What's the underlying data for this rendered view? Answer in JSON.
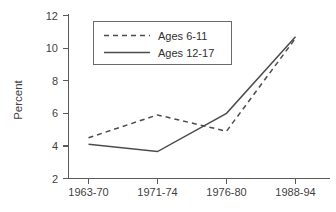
{
  "chart_data": {
    "type": "line",
    "title": "",
    "subtitle": "",
    "xlabel": "",
    "ylabel": "Percent",
    "categories": [
      "1963-70",
      "1971-74",
      "1976-80",
      "1988-94"
    ],
    "series": [
      {
        "name": "Ages 6-11",
        "style": "dashed",
        "color": "#4c4c4c",
        "values": [
          4.5,
          5.9,
          4.9,
          10.6
        ]
      },
      {
        "name": "Ages 12-17",
        "style": "solid",
        "color": "#4c4c4c",
        "values": [
          4.1,
          3.65,
          6.0,
          10.7
        ]
      }
    ],
    "ylim": [
      2,
      12
    ],
    "yticks": [
      2,
      4,
      6,
      8,
      10,
      12
    ],
    "yticklabels": [
      "2",
      "4",
      "6",
      "8",
      "10",
      "12"
    ],
    "xticklabels": [
      "1963-70",
      "1971-74",
      "1976-80",
      "1988-94"
    ],
    "grid": false,
    "legend_position": "top-center",
    "legend_entries": [
      "Ages 6-11",
      "Ages 12-17"
    ]
  },
  "axes": {
    "y_title": "Percent",
    "y_tick_0": "2",
    "y_tick_1": "4",
    "y_tick_2": "6",
    "y_tick_3": "8",
    "y_tick_4": "10",
    "y_tick_5": "12",
    "x_tick_0": "1963-70",
    "x_tick_1": "1971-74",
    "x_tick_2": "1976-80",
    "x_tick_3": "1988-94"
  },
  "legend": {
    "entry_0_label": "Ages 6-11",
    "entry_1_label": "Ages 12-17"
  },
  "colors": {
    "axis": "#5a5a5a",
    "line": "#4c4c4c",
    "text": "#3f3f3f",
    "background": "#ffffff"
  }
}
